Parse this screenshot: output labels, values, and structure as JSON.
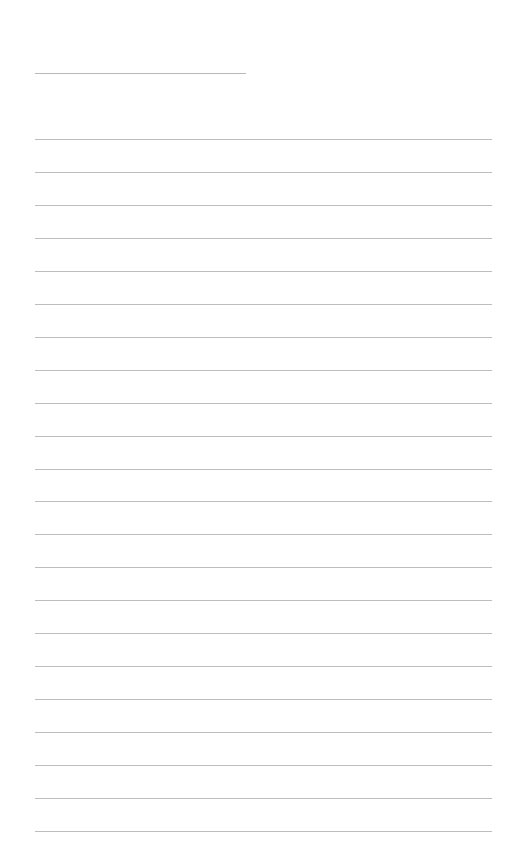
{
  "page": {
    "type": "lined-notepaper",
    "background_color": "#ffffff",
    "line_color": "#bdbdbd",
    "title_line": {
      "x": 35,
      "y": 73,
      "width": 211
    },
    "rules": {
      "count": 22,
      "x": 35,
      "width": 457,
      "first_y": 139,
      "spacing": 32.95
    }
  }
}
